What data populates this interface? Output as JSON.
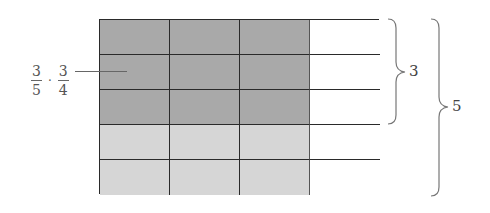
{
  "diagram": {
    "type": "area-model-fraction-multiplication",
    "grid": {
      "rows": 5,
      "columns": 4,
      "shaded_columns": 3,
      "dark_rows": 3,
      "colors": {
        "dark": "#a9a9a9",
        "light": "#d6d6d6",
        "unshaded": "#ffffff",
        "lines": "#2a2a2a"
      }
    },
    "label": {
      "fraction1": {
        "numerator": "3",
        "denominator": "5"
      },
      "operator": "·",
      "fraction2": {
        "numerator": "3",
        "denominator": "4"
      }
    },
    "braces": [
      {
        "label": "3",
        "spans_rows": 3
      },
      {
        "label": "5",
        "spans_rows": 5
      }
    ]
  }
}
